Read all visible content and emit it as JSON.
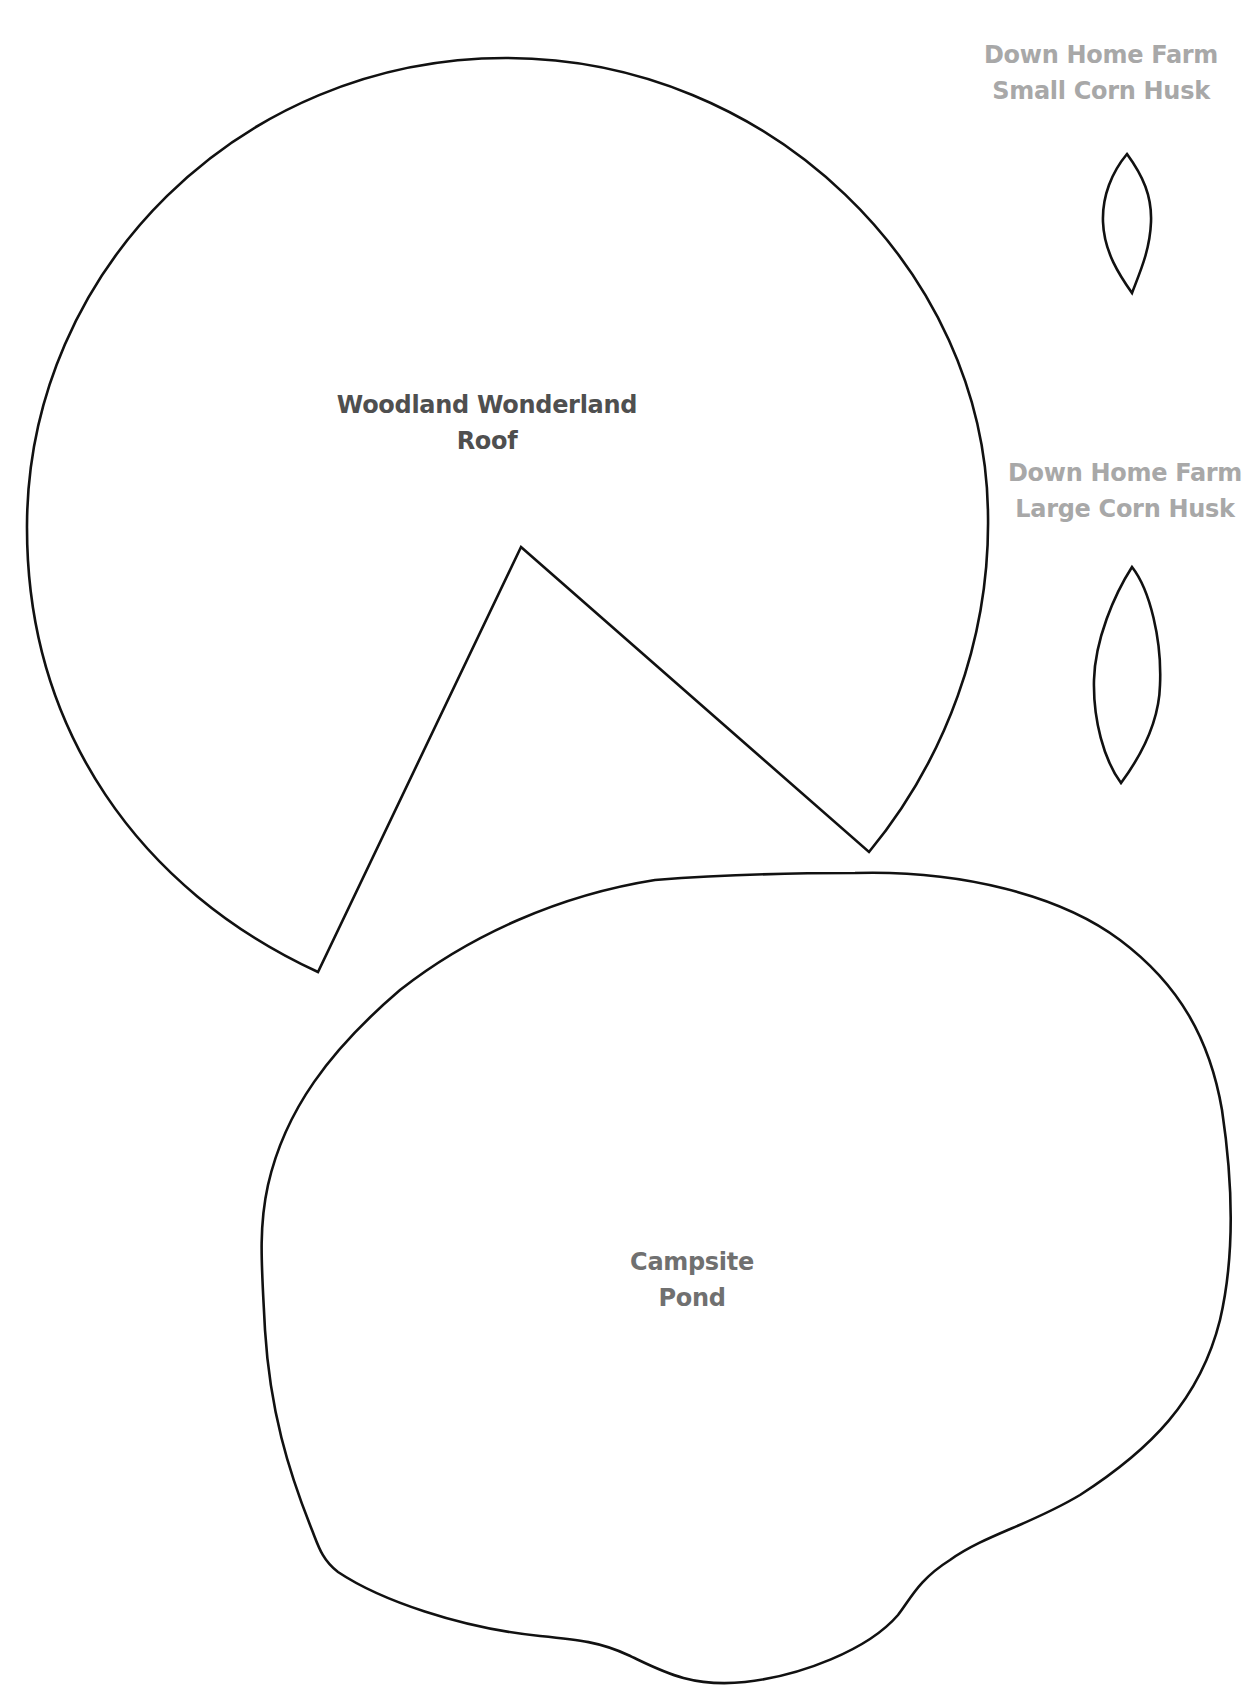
{
  "document": {
    "type": "printable craft cut-out template",
    "background_color": "#ffffff",
    "outline_color": "#111111"
  },
  "pieces": {
    "roof": {
      "line1": "Woodland Wonderland",
      "line2": "Roof",
      "shape": "circle-with-wedge-cutout",
      "label_color": "#4f4f4f"
    },
    "small_husk": {
      "line1": "Down Home Farm",
      "line2": "Small Corn Husk",
      "shape": "leaf",
      "label_color": "#a8a8a8"
    },
    "large_husk": {
      "line1": "Down Home Farm",
      "line2": "Large Corn Husk",
      "shape": "leaf",
      "label_color": "#a8a8a8"
    },
    "pond": {
      "line1": "Campsite",
      "line2": "Pond",
      "shape": "irregular-blob",
      "label_color": "#707070"
    }
  }
}
